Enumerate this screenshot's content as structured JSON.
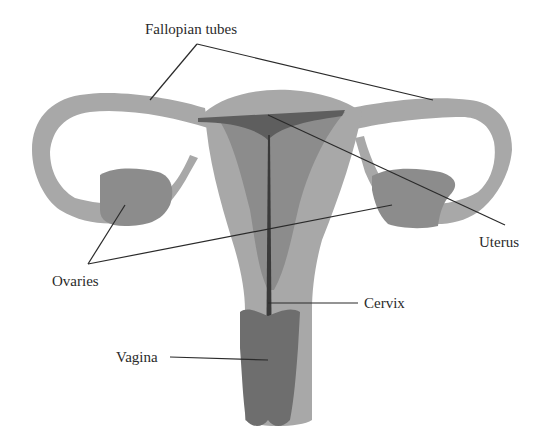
{
  "diagram": {
    "labels": {
      "fallopian_tubes": "Fallopian tubes",
      "uterus": "Uterus",
      "ovaries": "Ovaries",
      "cervix": "Cervix",
      "vagina": "Vagina"
    },
    "colors": {
      "background": "#ffffff",
      "tissue_light": "#a8a8a8",
      "tissue_mid": "#8c8c8c",
      "tissue_dark": "#6e6e6e",
      "cavity_line": "#3a3a3a",
      "leader_line": "#2a2a2a",
      "text": "#2a2a2a"
    }
  }
}
